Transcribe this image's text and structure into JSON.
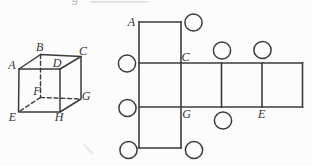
{
  "figure": {
    "paper_color": "#fcfcfc",
    "ink_color": "#3b3b3b",
    "cube": {
      "labels": {
        "A": "A",
        "B": "B",
        "C": "C",
        "D": "D",
        "E": "E",
        "F": "F",
        "G": "G",
        "H": "H"
      }
    },
    "net": {
      "labels": {
        "A": "A",
        "C": "C",
        "G": "G",
        "E": "E"
      },
      "answer_circle_count": 8
    },
    "artifacts": {
      "cropped_glyph": "g"
    }
  }
}
